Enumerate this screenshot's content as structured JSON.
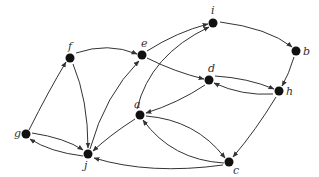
{
  "diagram": {
    "type": "directed-graph",
    "nodes": [
      {
        "id": "f",
        "label": "f",
        "x": 70,
        "y": 58,
        "lx": -2,
        "ly": -8
      },
      {
        "id": "e",
        "label": "e",
        "x": 142,
        "y": 55,
        "lx": -1,
        "ly": -8
      },
      {
        "id": "i",
        "label": "i",
        "x": 213,
        "y": 23,
        "lx": -2,
        "ly": -9
      },
      {
        "id": "b",
        "label": "b",
        "x": 296,
        "y": 51,
        "lx": 7,
        "ly": 4
      },
      {
        "id": "d",
        "label": "d",
        "x": 209,
        "y": 80,
        "lx": -1,
        "ly": -8
      },
      {
        "id": "h",
        "label": "h",
        "x": 279,
        "y": 91,
        "lx": 7,
        "ly": 4
      },
      {
        "id": "a",
        "label": "a",
        "x": 140,
        "y": 115,
        "lx": -6,
        "ly": -7
      },
      {
        "id": "g",
        "label": "g",
        "x": 26,
        "y": 134,
        "lx": -12,
        "ly": 3
      },
      {
        "id": "j",
        "label": "j",
        "x": 88,
        "y": 154,
        "lx": -4,
        "ly": 15
      },
      {
        "id": "c",
        "label": "c",
        "x": 229,
        "y": 162,
        "lx": 4,
        "ly": 12
      }
    ],
    "edges": [
      {
        "from": "g",
        "to": "f",
        "path": "M29,130 Q48,92 66,62"
      },
      {
        "from": "f",
        "to": "e",
        "path": "M76,53 Q108,42 137,54"
      },
      {
        "from": "e",
        "to": "i",
        "path": "M147,51 Q177,32 208,24"
      },
      {
        "from": "a",
        "to": "i",
        "path": "M137,109 Q150,55 209,27"
      },
      {
        "from": "i",
        "to": "b",
        "path": "M220,22 Q268,28 292,47"
      },
      {
        "from": "b",
        "to": "h",
        "path": "M294,57 Q289,74 282,86"
      },
      {
        "from": "e",
        "to": "d",
        "path": "M147,58 Q175,72 204,79"
      },
      {
        "from": "d",
        "to": "h",
        "path": "M215,76 Q248,78 274,89"
      },
      {
        "from": "h",
        "to": "d",
        "path": "M273,94 Q242,96 214,83"
      },
      {
        "from": "d",
        "to": "a",
        "path": "M205,85 Q178,103 146,113"
      },
      {
        "from": "h",
        "to": "c",
        "path": "M276,97 Q256,130 233,157"
      },
      {
        "from": "a",
        "to": "c",
        "path": "M146,116 Q196,120 225,158"
      },
      {
        "from": "c",
        "to": "a",
        "path": "M224,163 Q172,160 143,120"
      },
      {
        "from": "c",
        "to": "j",
        "path": "M223,165 Q150,175 94,158"
      },
      {
        "from": "a",
        "to": "j",
        "path": "M135,119 Q110,135 93,151"
      },
      {
        "from": "f",
        "to": "j",
        "path": "M73,64 Q88,100 88,148"
      },
      {
        "from": "j",
        "to": "e",
        "path": "M90,149 Q105,95 139,61"
      },
      {
        "from": "g",
        "to": "j",
        "path": "M32,133 Q65,138 83,150"
      },
      {
        "from": "j",
        "to": "g",
        "path": "M83,156 Q50,152 30,139"
      }
    ],
    "colors": {
      "node": "#111111",
      "edge": "#333333",
      "background": "#ffffff"
    }
  }
}
